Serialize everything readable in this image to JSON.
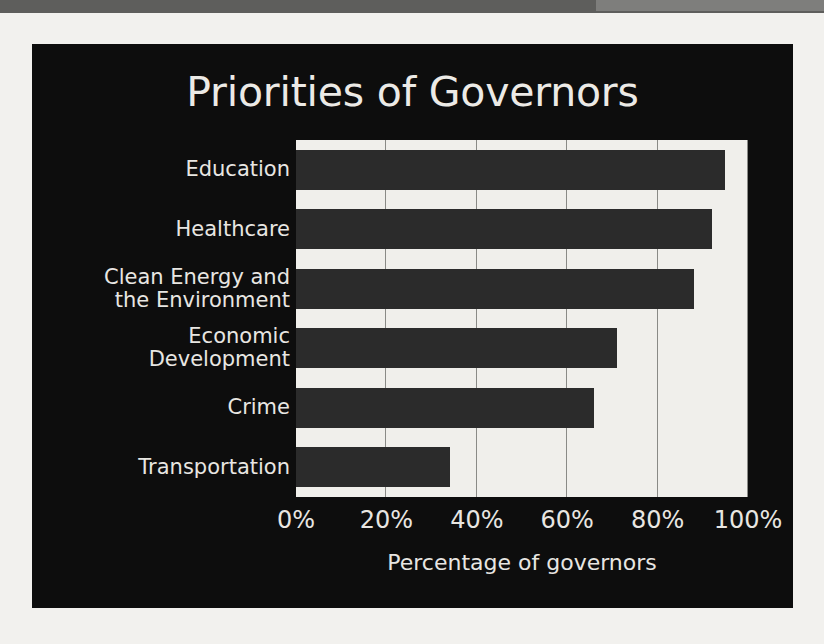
{
  "chart_data": {
    "type": "bar",
    "orientation": "horizontal",
    "title": "Priorities of Governors",
    "xlabel": "Percentage of governors",
    "ylabel": "",
    "categories": [
      "Education",
      "Healthcare",
      "Clean Energy and\nthe Environment",
      "Economic\nDevelopment",
      "Crime",
      "Transportation"
    ],
    "values": [
      95,
      92,
      88,
      71,
      66,
      34
    ],
    "xlim": [
      0,
      100
    ],
    "xticks": [
      0,
      20,
      40,
      60,
      80,
      100
    ],
    "xtick_labels": [
      "0%",
      "20%",
      "40%",
      "60%",
      "80%",
      "100%"
    ],
    "grid": "vertical",
    "legend": "none",
    "colors": {
      "panel_background": "#0d0d0d",
      "plot_background": "#f0efeb",
      "bar": "#2b2b2b",
      "gridline": "#8a8a86",
      "text": "#e8e6e2",
      "page_background": "#f2f1ee",
      "top_strip": "#5e5e5c"
    }
  }
}
